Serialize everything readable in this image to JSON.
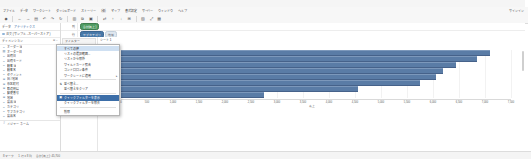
{
  "app": {
    "title": "Tableau - 売上分析",
    "account_label": "サインイン"
  },
  "menubar": {
    "items": [
      {
        "label": "ファイル"
      },
      {
        "label": "データ"
      },
      {
        "label": "ワークシート"
      },
      {
        "label": "ダッシュボード"
      },
      {
        "label": "ストーリー"
      },
      {
        "label": "分析"
      },
      {
        "label": "マップ"
      },
      {
        "label": "書式設定"
      },
      {
        "label": "サーバー"
      },
      {
        "label": "ウィンドウ"
      },
      {
        "label": "ヘルプ"
      }
    ]
  },
  "toolbar": {
    "buttons": [
      {
        "name": "tableau-logo-icon",
        "glyph": "◆"
      },
      {
        "name": "back-icon",
        "glyph": "←"
      },
      {
        "name": "forward-icon",
        "glyph": "→"
      },
      {
        "name": "save-icon",
        "glyph": "▤"
      },
      {
        "name": "undo-icon",
        "glyph": "↶"
      },
      {
        "name": "redo-icon",
        "glyph": "↷"
      },
      {
        "name": "refresh-icon",
        "glyph": "↻"
      },
      {
        "name": "new-worksheet-icon",
        "glyph": "▥"
      },
      {
        "name": "duplicate-sheet-icon",
        "glyph": "⧉"
      },
      {
        "name": "clear-sheet-icon",
        "glyph": "▣"
      },
      {
        "name": "swap-axes-icon",
        "glyph": "⇄"
      },
      {
        "name": "sort-ascending-icon",
        "glyph": "↑"
      },
      {
        "name": "sort-descending-icon",
        "glyph": "↓"
      },
      {
        "name": "group-icon",
        "glyph": "⊞"
      },
      {
        "name": "highlight-icon",
        "glyph": "▨"
      },
      {
        "name": "fit-icon",
        "glyph": "⤢"
      },
      {
        "name": "show-me-icon",
        "glyph": "▦"
      }
    ]
  },
  "left_pane": {
    "header": {
      "label": "データ",
      "value": "アナリティクス"
    },
    "datasource": {
      "label": "注文 (サンプル - スーパーストア)"
    },
    "section": {
      "label": "ディメンション",
      "right": "⊞ ⌄"
    },
    "dimensions": [
      {
        "icon": "abc-icon",
        "name": "オーダー Id"
      },
      {
        "icon": "calendar-icon",
        "name": "オーダー日"
      },
      {
        "icon": "abc-icon",
        "name": "出荷日"
      },
      {
        "icon": "abc-icon",
        "name": "出荷モード"
      },
      {
        "icon": "abc-icon",
        "name": "顧客 Id"
      },
      {
        "icon": "abc-icon",
        "name": "顧客名"
      },
      {
        "icon": "abc-icon",
        "name": "セグメント"
      },
      {
        "icon": "globe-icon",
        "name": "国 / 地域"
      },
      {
        "icon": "globe-icon",
        "name": "市区町村"
      },
      {
        "icon": "globe-icon",
        "name": "都道府県"
      },
      {
        "icon": "abc-icon",
        "name": "郵便番号"
      },
      {
        "icon": "globe-icon",
        "name": "地域"
      },
      {
        "icon": "abc-icon",
        "name": "製品 Id"
      },
      {
        "icon": "abc-icon",
        "name": "カテゴリ"
      },
      {
        "icon": "abc-icon",
        "name": "サブカテゴリ"
      },
      {
        "icon": "abc-icon",
        "name": "製品名"
      },
      {
        "icon": "hash-icon",
        "name": "メジャー ネーム"
      }
    ]
  },
  "shelves": [
    {
      "label": "列",
      "pills": [
        {
          "text": "合計(売上)",
          "style": "green"
        }
      ]
    },
    {
      "label": "行",
      "pills": [
        {
          "text": "サブカテゴリ",
          "style": "blue"
        },
        {
          "text": "地域",
          "style": "ghost"
        }
      ]
    }
  ],
  "cards": {
    "filters": {
      "title": "フィルター",
      "items": []
    },
    "marks": {
      "title": "マーク",
      "type": "自動",
      "items": [
        {
          "icon": "color-icon",
          "label": "色"
        },
        {
          "icon": "size-icon",
          "label": "サイズ"
        },
        {
          "icon": "label-icon",
          "label": "ラベル"
        },
        {
          "icon": "detail-icon",
          "label": "詳細"
        },
        {
          "icon": "tooltip-icon",
          "label": "ツールヒント"
        }
      ]
    }
  },
  "worksheet": {
    "sheet_tab": "シート 1",
    "close_button": "×"
  },
  "context_menu": {
    "title": "フィルター",
    "items": [
      {
        "label": "すべての値",
        "marker": "",
        "selected": false,
        "hover": true,
        "submenu": false
      },
      {
        "label": "リストの選択範囲...",
        "marker": "",
        "selected": false,
        "submenu": false
      },
      {
        "label": "リストから除外",
        "marker": "",
        "selected": false,
        "submenu": false
      },
      {
        "label": "ワイルドカード照合",
        "marker": "",
        "selected": false,
        "submenu": false
      },
      {
        "label": "コンドロロン条件",
        "marker": "",
        "selected": false,
        "submenu": false
      },
      {
        "label": "ワークシートに適用",
        "marker": "",
        "selected": false,
        "submenu": true
      },
      {
        "separator": true
      },
      {
        "label": "並べ替え...",
        "marker": "⇅",
        "selected": false,
        "submenu": false
      },
      {
        "label": "並べ替えをクリア",
        "marker": "",
        "selected": false,
        "submenu": false
      },
      {
        "separator2": true
      },
      {
        "label": "クイックフィルターを表示",
        "marker": "▣",
        "selected": true,
        "submenu": false
      },
      {
        "label": "クイックフィルターを除去",
        "marker": "",
        "selected": false,
        "submenu": false
      },
      {
        "separator3": true
      },
      {
        "label": "削除",
        "marker": "",
        "selected": false,
        "submenu": false
      }
    ]
  },
  "chart_data": {
    "type": "bar",
    "orientation": "horizontal",
    "title": "シート 1",
    "xlabel": "売上",
    "ylabel": "サブカテゴリ",
    "categories": [
      "椅子",
      "電話機",
      "画材",
      "本棚",
      "保管箱",
      "机",
      "コピー機",
      "アプライアンス"
    ],
    "values": [
      7100,
      6850,
      6450,
      6200,
      6050,
      5750,
      4550,
      2750
    ],
    "xlim": [
      0,
      7500
    ],
    "xticks": [
      0,
      500,
      1000,
      1500,
      2000,
      2500,
      3000,
      3500,
      4000,
      4500,
      5000,
      5500,
      6000,
      6500,
      7000,
      7500
    ],
    "xticklabels": [
      "0",
      "500",
      "1,000",
      "1,500",
      "2,000",
      "2,500",
      "3,000",
      "3,500",
      "4,000",
      "4,500",
      "5,000",
      "5,500",
      "6,000",
      "6,500",
      "7,000",
      "7,500"
    ],
    "bar_color": "#5a7ca6",
    "grid": true,
    "legend": false
  },
  "statusbar": {
    "marks": "8 マーク",
    "rows": "1 行 x 8 列",
    "sum": "合計(売上): 45,700"
  }
}
